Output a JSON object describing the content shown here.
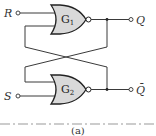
{
  "diagram": {
    "type": "SR latch (cross-coupled NOR gates)",
    "inputs": [
      {
        "label": "R",
        "position": "top-left"
      },
      {
        "label": "S",
        "position": "bottom-left"
      }
    ],
    "gates": [
      {
        "name": "G",
        "subscript": "1",
        "type": "NOR",
        "position": "top"
      },
      {
        "name": "G",
        "subscript": "2",
        "type": "NOR",
        "position": "bottom"
      }
    ],
    "outputs": [
      {
        "label": "Q",
        "position": "top-right"
      },
      {
        "label": "Q̄",
        "position": "bottom-right"
      }
    ],
    "caption": "(a)",
    "colors": {
      "gate_fill": "#d9d9d9",
      "wire": "#3a3a3a"
    }
  }
}
